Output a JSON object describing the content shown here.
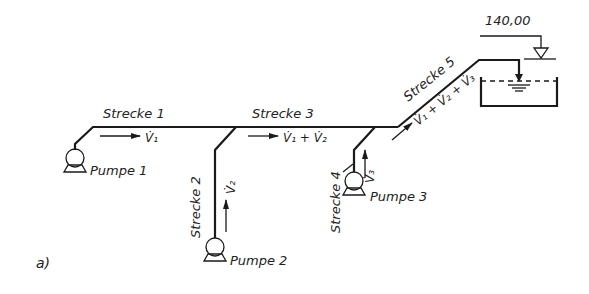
{
  "figure_label": "a)",
  "colors": {
    "line": "#1a1a1a",
    "text": "#222222",
    "background": "#ffffff"
  },
  "elevation": {
    "value": "140,00",
    "icon": "water-level-triangle-icon"
  },
  "segments": [
    {
      "id": 1,
      "label": "Strecke 1",
      "flow": "V̇₁"
    },
    {
      "id": 2,
      "label": "Strecke 2",
      "flow": "V̇₂"
    },
    {
      "id": 3,
      "label": "Strecke 3",
      "flow": "V̇₁ + V̇₂"
    },
    {
      "id": 4,
      "label": "Strecke 4",
      "flow": "V̇₃"
    },
    {
      "id": 5,
      "label": "Strecke 5",
      "flow": "V̇₁ + V̇₂ + V̇₃"
    }
  ],
  "pumps": [
    {
      "label": "Pumpe 1",
      "icon": "pump-icon"
    },
    {
      "label": "Pumpe 2",
      "icon": "pump-icon"
    },
    {
      "label": "Pumpe 3",
      "icon": "pump-icon"
    }
  ],
  "tank": {
    "icon": "reservoir-tank-icon"
  }
}
